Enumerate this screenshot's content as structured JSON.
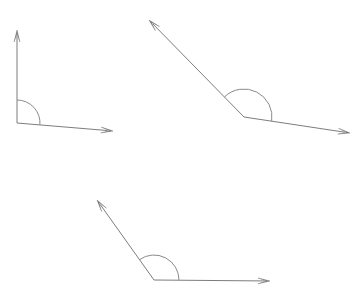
{
  "figure": {
    "background_color": "#ffffff",
    "line_color": "#7d7d7d",
    "arc_color": "#8a8a8a",
    "arrow_color": "#6f6f6f",
    "canvas": {
      "width": 364,
      "height": 302
    },
    "angles": [
      {
        "id": "angle-1",
        "name": "right-angle-top-left",
        "type": "right",
        "measure_degrees": 90,
        "vertex": {
          "x": 17,
          "y": 123
        },
        "rays": [
          {
            "id": "ray-1-up",
            "name": "vertical-ray-up",
            "end": {
              "x": 17,
              "y": 30
            },
            "direction_degrees": 90,
            "has_arrowhead": true
          },
          {
            "id": "ray-1-right",
            "name": "horizontal-ray-right",
            "end": {
              "x": 113,
              "y": 131
            },
            "direction_degrees": -4.8,
            "has_arrowhead": true
          }
        ],
        "arc": {
          "radius": 23,
          "start_degrees": 90,
          "end_degrees": -4.8
        }
      },
      {
        "id": "angle-2",
        "name": "obtuse-angle-top-right",
        "type": "obtuse",
        "measure_degrees": 150,
        "vertex": {
          "x": 244,
          "y": 117
        },
        "rays": [
          {
            "id": "ray-2-upleft",
            "name": "ray-up-left",
            "end": {
              "x": 149,
              "y": 20
            },
            "direction_degrees": 134.4,
            "has_arrowhead": true
          },
          {
            "id": "ray-2-downright",
            "name": "ray-down-right",
            "end": {
              "x": 350,
              "y": 133
            },
            "direction_degrees": -8.6,
            "has_arrowhead": true
          }
        ],
        "arc": {
          "radius": 28,
          "start_degrees": 134.4,
          "end_degrees": -8.6
        }
      },
      {
        "id": "angle-3",
        "name": "obtuse-angle-bottom",
        "type": "obtuse",
        "measure_degrees": 125,
        "vertex": {
          "x": 154,
          "y": 280
        },
        "rays": [
          {
            "id": "ray-3-upleft",
            "name": "ray-up-left",
            "end": {
              "x": 97,
              "y": 200
            },
            "direction_degrees": 125.5,
            "has_arrowhead": true
          },
          {
            "id": "ray-3-right",
            "name": "horizontal-ray-right",
            "end": {
              "x": 270,
              "y": 281
            },
            "direction_degrees": -0.3,
            "has_arrowhead": true
          }
        ],
        "arc": {
          "radius": 25,
          "start_degrees": 125.5,
          "end_degrees": -0.3
        }
      }
    ]
  }
}
